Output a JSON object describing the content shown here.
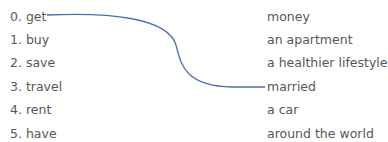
{
  "exercise": {
    "left_items": [
      {
        "number": "0.",
        "word": "get"
      },
      {
        "number": "1.",
        "word": "buy"
      },
      {
        "number": "2.",
        "word": "save"
      },
      {
        "number": "3.",
        "word": "travel"
      },
      {
        "number": "4.",
        "word": "rent"
      },
      {
        "number": "5.",
        "word": "have"
      }
    ],
    "right_items": [
      "money",
      "an apartment",
      "a healthier lifestyle",
      "married",
      "a car",
      "around the world"
    ],
    "connections": [
      {
        "from": "0. get",
        "to": "married",
        "color": "#4a6db3"
      }
    ]
  }
}
